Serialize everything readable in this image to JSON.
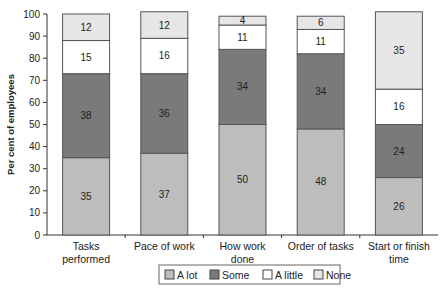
{
  "chart_data": {
    "type": "bar",
    "stacked": true,
    "title": "",
    "xlabel": "",
    "ylabel": "Per cent of employees",
    "ylim": [
      0,
      100
    ],
    "yticks": [
      0,
      10,
      20,
      30,
      40,
      50,
      60,
      70,
      80,
      90,
      100
    ],
    "grid": false,
    "legend_position": "bottom",
    "categories": [
      "Tasks performed",
      "Pace of work",
      "How work done",
      "Order of tasks",
      "Start or finish time"
    ],
    "category_lines": [
      [
        "Tasks",
        "performed"
      ],
      [
        "Pace of work"
      ],
      [
        "How work",
        "done"
      ],
      [
        "Order of tasks"
      ],
      [
        "Start or finish",
        "time"
      ]
    ],
    "series": [
      {
        "name": "A lot",
        "color": "#bdbdbd",
        "values": [
          35,
          37,
          50,
          48,
          26
        ]
      },
      {
        "name": "Some",
        "color": "#7a7a7a",
        "values": [
          38,
          36,
          34,
          34,
          24
        ]
      },
      {
        "name": "A little",
        "color": "#ffffff",
        "values": [
          15,
          16,
          11,
          11,
          16
        ]
      },
      {
        "name": "None",
        "color": "#e6e6e6",
        "values": [
          12,
          12,
          4,
          6,
          35
        ]
      }
    ]
  }
}
